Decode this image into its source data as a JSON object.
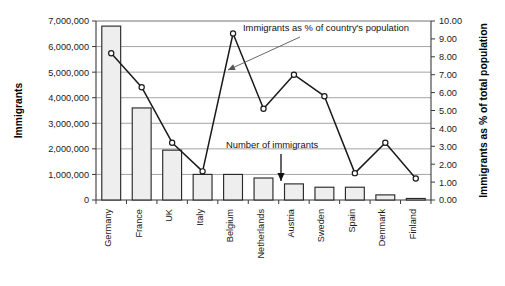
{
  "chart_data": {
    "type": "bar",
    "title": "",
    "categories": [
      "Germany",
      "France",
      "UK",
      "Italy",
      "Belgium",
      "Netherlands",
      "Austria",
      "Sweden",
      "Spain",
      "Denmark",
      "Finland"
    ],
    "series": [
      {
        "name": "Number of immigrants",
        "type": "bar",
        "axis": "left",
        "values": [
          6800000,
          3600000,
          1950000,
          1000000,
          1000000,
          860000,
          630000,
          500000,
          500000,
          200000,
          60000
        ]
      },
      {
        "name": "Immigrants as % of country's population",
        "type": "line",
        "axis": "right",
        "values": [
          8.2,
          6.3,
          3.2,
          1.6,
          9.3,
          5.1,
          7.0,
          5.8,
          1.5,
          3.2,
          1.2
        ]
      }
    ],
    "ylabel": "Immigrants",
    "ylabel_right": "Immigrants as % of total population",
    "xlabel": "",
    "ylim": [
      0,
      7000000
    ],
    "ylim_right": [
      0,
      10
    ],
    "yticks": [
      0,
      1000000,
      2000000,
      3000000,
      4000000,
      5000000,
      6000000,
      7000000
    ],
    "ytick_labels": [
      "0",
      "1,000,000",
      "2,000,000",
      "3,000,000",
      "4,000,000",
      "5,000,000",
      "6,000,000",
      "7,000,000"
    ],
    "yticks_right": [
      0,
      1,
      2,
      3,
      4,
      5,
      6,
      7,
      8,
      9,
      10
    ],
    "ytick_labels_right": [
      "0.00",
      "1.00",
      "2.00",
      "3.00",
      "4.00",
      "5.00",
      "6.00",
      "7.00",
      "8.00",
      "9.00",
      "10.00"
    ],
    "grid": true,
    "legend_position": "annotations",
    "annotations": [
      {
        "name": "line-series-callout",
        "text": "Immigrants as % of country's population",
        "points_to": "Austria"
      },
      {
        "name": "bar-series-callout",
        "text": "Number of immigrants",
        "points_to": "Netherlands"
      }
    ],
    "colors": {
      "bar_fill": "#eeeeee",
      "bar_stroke": "#2a2a2a",
      "line": "#1a1a1a",
      "grid": "#9a9a9a",
      "axis": "#3a3a3a"
    }
  }
}
